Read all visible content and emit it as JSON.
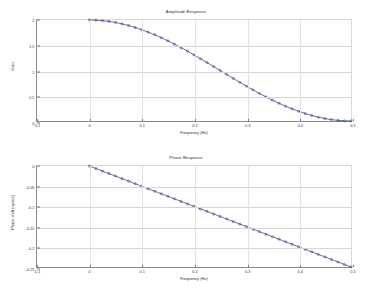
{
  "figure": {
    "background": "#ffffff",
    "line_color": "#3a4a8c",
    "marker_color": "#2b3a7a",
    "grid_color": "#d5d5d5",
    "axis_color": "#8a8a8a"
  },
  "panels": [
    {
      "id": "amplitude",
      "title": "Amplitude Response",
      "xlabel": "Frequency (Hz)",
      "ylabel": "Gain"
    },
    {
      "id": "phase",
      "title": "Phase Response",
      "xlabel": "Frequency (Hz)",
      "ylabel": "Phase shift (cycles)"
    }
  ],
  "chart_data": [
    {
      "type": "line",
      "title": "Amplitude Response",
      "xlabel": "Frequency (Hz)",
      "ylabel": "Gain",
      "xlim": [
        -0.1,
        0.5
      ],
      "ylim": [
        0,
        2
      ],
      "xticks": [
        -0.1,
        0,
        0.1,
        0.2,
        0.3,
        0.4,
        0.5
      ],
      "xticklabels": [
        "-0.1",
        "0",
        "0.1",
        "0.2",
        "0.3",
        "0.4",
        "0.5"
      ],
      "yticks": [
        0,
        0.5,
        1,
        1.5,
        2
      ],
      "yticklabels": [
        "0",
        "0.5",
        "1",
        "1.5",
        "2"
      ],
      "grid": true,
      "legend": "none",
      "markers": "circle",
      "series": [
        {
          "name": "gain",
          "x": [
            0.0,
            0.0125,
            0.025,
            0.0375,
            0.05,
            0.0625,
            0.075,
            0.0875,
            0.1,
            0.1125,
            0.125,
            0.1375,
            0.15,
            0.1625,
            0.175,
            0.1875,
            0.2,
            0.2125,
            0.225,
            0.2375,
            0.25,
            0.2625,
            0.275,
            0.2875,
            0.3,
            0.3125,
            0.325,
            0.3375,
            0.35,
            0.3625,
            0.375,
            0.3875,
            0.4,
            0.4125,
            0.425,
            0.4375,
            0.45,
            0.4625,
            0.475,
            0.4875,
            0.5
          ],
          "y": [
            2.0,
            1.9969,
            1.9877,
            1.9724,
            1.9511,
            1.9239,
            1.891,
            1.8524,
            1.8084,
            1.7593,
            1.7071,
            1.6494,
            1.5878,
            1.5225,
            1.454,
            1.3827,
            1.309,
            1.2334,
            1.1564,
            1.0785,
            1.0,
            0.9215,
            0.8436,
            0.7666,
            0.691,
            0.6173,
            0.546,
            0.4775,
            0.4122,
            0.3506,
            0.2929,
            0.2407,
            0.1916,
            0.1476,
            0.109,
            0.0761,
            0.0489,
            0.0276,
            0.0123,
            0.0031,
            0.0
          ]
        }
      ]
    },
    {
      "type": "line",
      "title": "Phase Response",
      "xlabel": "Frequency (Hz)",
      "ylabel": "Phase shift (cycles)",
      "xlim": [
        -0.1,
        0.5
      ],
      "ylim": [
        -0.25,
        0
      ],
      "xticks": [
        -0.1,
        0,
        0.1,
        0.2,
        0.3,
        0.4,
        0.5
      ],
      "xticklabels": [
        "-0.1",
        "0",
        "0.1",
        "0.2",
        "0.3",
        "0.4",
        "0.5"
      ],
      "yticks": [
        -0.25,
        -0.2,
        -0.15,
        -0.1,
        -0.05,
        0
      ],
      "yticklabels": [
        "-0.25",
        "-0.2",
        "-0.15",
        "-0.1",
        "-0.05",
        "0"
      ],
      "grid": true,
      "legend": "none",
      "markers": "circle",
      "series": [
        {
          "name": "phase",
          "x": [
            0.0,
            0.0125,
            0.025,
            0.0375,
            0.05,
            0.0625,
            0.075,
            0.0875,
            0.1,
            0.1125,
            0.125,
            0.1375,
            0.15,
            0.1625,
            0.175,
            0.1875,
            0.2,
            0.2125,
            0.225,
            0.2375,
            0.25,
            0.2625,
            0.275,
            0.2875,
            0.3,
            0.3125,
            0.325,
            0.3375,
            0.35,
            0.3625,
            0.375,
            0.3875,
            0.4,
            0.4125,
            0.425,
            0.4375,
            0.45,
            0.4625,
            0.475,
            0.4875,
            0.5
          ],
          "y": [
            0.0,
            -0.00625,
            -0.0125,
            -0.01875,
            -0.025,
            -0.03125,
            -0.0375,
            -0.04375,
            -0.05,
            -0.05625,
            -0.0625,
            -0.06875,
            -0.075,
            -0.08125,
            -0.0875,
            -0.09375,
            -0.1,
            -0.10625,
            -0.1125,
            -0.11875,
            -0.125,
            -0.13125,
            -0.1375,
            -0.14375,
            -0.15,
            -0.15625,
            -0.1625,
            -0.16875,
            -0.175,
            -0.18125,
            -0.1875,
            -0.19375,
            -0.2,
            -0.20625,
            -0.2125,
            -0.21875,
            -0.225,
            -0.23125,
            -0.2375,
            -0.24375,
            -0.25
          ]
        }
      ]
    }
  ]
}
